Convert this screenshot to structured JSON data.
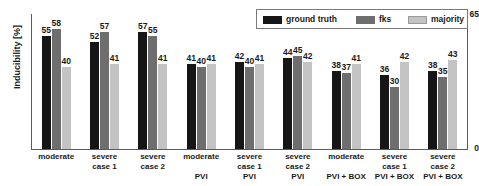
{
  "chart_data": {
    "type": "bar",
    "title": "",
    "xlabel": "",
    "ylabel": "Inducibility [%]",
    "ylim": [
      0,
      65
    ],
    "ytick_labels": [
      "65",
      "0"
    ],
    "grid": false,
    "legend_position": "top-right",
    "categories": [
      "moderate",
      "severe case 1",
      "severe case 2",
      "moderate PVI",
      "severe case 1 PVI",
      "severe case 2 PVI",
      "moderate PVI + BOX",
      "severe case 1 PVI + BOX",
      "severe case 2 PVI + BOX"
    ],
    "category_lines": [
      {
        "line1": "moderate",
        "line2": "",
        "group": ""
      },
      {
        "line1": "severe",
        "line2": "case 1",
        "group": ""
      },
      {
        "line1": "severe",
        "line2": "case 2",
        "group": ""
      },
      {
        "line1": "moderate",
        "line2": "",
        "group": "PVI"
      },
      {
        "line1": "severe",
        "line2": "case 1",
        "group": "PVI"
      },
      {
        "line1": "severe",
        "line2": "case 2",
        "group": "PVI"
      },
      {
        "line1": "moderate",
        "line2": "",
        "group": "PVI + BOX"
      },
      {
        "line1": "severe",
        "line2": "case 1",
        "group": "PVI + BOX"
      },
      {
        "line1": "severe",
        "line2": "case 2",
        "group": "PVI + BOX"
      }
    ],
    "series": [
      {
        "name": "ground truth",
        "color": "#161616",
        "values": [
          55,
          52,
          57,
          41,
          42,
          44,
          38,
          36,
          38
        ]
      },
      {
        "name": "fks",
        "color": "#6e6e6e",
        "values": [
          58,
          57,
          55,
          40,
          40,
          45,
          37,
          30,
          35
        ]
      },
      {
        "name": "majority",
        "color": "#c3c3c3",
        "values": [
          40,
          41,
          41,
          41,
          41,
          42,
          41,
          42,
          43
        ]
      }
    ]
  },
  "legend": {
    "items": [
      {
        "label": "ground truth"
      },
      {
        "label": "fks"
      },
      {
        "label": "majority"
      }
    ]
  }
}
